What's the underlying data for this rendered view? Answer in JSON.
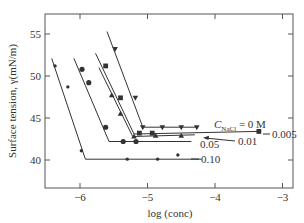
{
  "chart_data": {
    "type": "line",
    "title": "",
    "xlabel": "log (conc)",
    "ylabel": "Surface tension, γ(mN/m)",
    "xlim": [
      -6.8,
      -2.95
    ],
    "ylim": [
      37,
      57.5
    ],
    "x_ticks": [
      -6,
      -5,
      -4,
      -3
    ],
    "x_tick_labels": [
      "−6",
      "−5",
      "−4",
      "−3"
    ],
    "y_ticks": [
      40,
      45,
      50,
      55
    ],
    "y_tick_labels": [
      "40",
      "45",
      "50",
      "55"
    ],
    "grid": false,
    "legend_title": "C_NaCl = 0 M",
    "series": [
      {
        "name": "0 M",
        "label": "C",
        "label_sub": "NaCl",
        "label_tail": " = 0 M",
        "marker": "triangle-down",
        "line": [
          [
            -5.6,
            55.3
          ],
          [
            -5.07,
            43.9
          ],
          [
            -4.25,
            43.9
          ]
        ],
        "points": [
          [
            -5.48,
            53.2
          ],
          [
            -5.18,
            47.4
          ],
          [
            -5.07,
            43.9
          ],
          [
            -4.78,
            43.9
          ],
          [
            -4.5,
            43.9
          ],
          [
            -4.27,
            43.9
          ]
        ]
      },
      {
        "name": "0.005 M",
        "label": "0.005",
        "marker": "square",
        "line": [
          [
            -5.77,
            52.7
          ],
          [
            -5.2,
            43.1
          ],
          [
            -3.35,
            43.4
          ]
        ],
        "points": [
          [
            -5.62,
            51.2
          ],
          [
            -5.4,
            47.4
          ],
          [
            -5.12,
            43.2
          ],
          [
            -4.93,
            43.2
          ],
          [
            -3.35,
            43.4
          ]
        ]
      },
      {
        "name": "0.01 M",
        "label": "0.01",
        "marker": "triangle-up",
        "line": [
          [
            -5.72,
            51.0
          ],
          [
            -5.22,
            42.8
          ],
          [
            -4.3,
            43.0
          ]
        ],
        "points": [
          [
            -5.53,
            47.7
          ],
          [
            -5.4,
            45.5
          ],
          [
            -5.2,
            42.8
          ],
          [
            -4.88,
            42.9
          ],
          [
            -4.5,
            42.9
          ]
        ]
      },
      {
        "name": "0.05 M",
        "label": "0.05",
        "marker": "circle",
        "line": [
          [
            -6.09,
            52.1
          ],
          [
            -5.57,
            42.2
          ],
          [
            -4.35,
            42.2
          ]
        ],
        "points": [
          [
            -5.97,
            50.8
          ],
          [
            -5.87,
            49.2
          ],
          [
            -5.62,
            43.9
          ],
          [
            -5.36,
            42.2
          ],
          [
            -5.17,
            42.2
          ]
        ]
      },
      {
        "name": "0.10 M",
        "label": "0.10",
        "marker": "diamond",
        "line": [
          [
            -6.42,
            52.1
          ],
          [
            -5.92,
            40.1
          ],
          [
            -4.2,
            40.1
          ]
        ],
        "points": [
          [
            -6.37,
            51.2
          ],
          [
            -6.18,
            48.7
          ],
          [
            -5.98,
            41.1
          ],
          [
            -5.3,
            40.1
          ],
          [
            -4.85,
            40.1
          ],
          [
            -4.55,
            40.6
          ]
        ]
      }
    ],
    "annotations": [
      {
        "text": "0.005",
        "at": [
          -3.3,
          43.4
        ],
        "leader": "dash"
      },
      {
        "text": "0.01",
        "at": [
          -3.87,
          42.8
        ],
        "leader": "arrow-left"
      },
      {
        "text": "0.05",
        "at": [
          -4.45,
          41.9
        ],
        "leader": "none"
      },
      {
        "text": "0.10",
        "at": [
          -4.2,
          40.2
        ],
        "leader": "dash"
      }
    ]
  },
  "colors": {
    "ink": "#333333",
    "axis": "#555555",
    "background": "#ffffff"
  }
}
